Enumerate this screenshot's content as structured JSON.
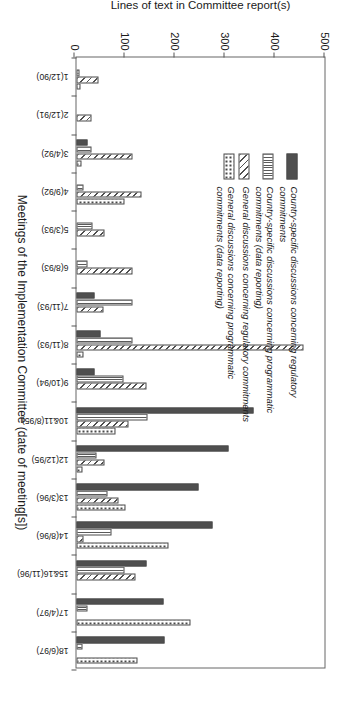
{
  "chart_data": {
    "type": "bar",
    "title": "",
    "subtitle": "",
    "xlabel": "Meetings of the Implementation Committee (date of meeting[s])",
    "ylabel": "Lines of text in Committee report(s)",
    "ylim": [
      0,
      500
    ],
    "yticks": [
      0,
      100,
      200,
      300,
      400,
      500
    ],
    "ytick_labels": [
      "0",
      "100",
      "200",
      "300",
      "400",
      "500"
    ],
    "grid": false,
    "orientation": "vertical-bars-rotated-90",
    "legend_position": "upper-left-inside",
    "categories": [
      "1(12/90)",
      "2(12/91)",
      "3(4/92)",
      "4(9/92)",
      "5(3/93)",
      "6(8/93)",
      "7(11/93)",
      "8(11/93)",
      "9(10/94)",
      "10&11(8/95)",
      "12(12/95)",
      "13(3/96)",
      "14(8/96)",
      "15&16(11/96)",
      "17(4/97)",
      "18(6/97)"
    ],
    "series": [
      {
        "name": "Country-specific discussions concerning regulatory commitments",
        "pattern": "solid",
        "color": "#4f4f4f",
        "values": [
          0,
          0,
          22,
          0,
          0,
          0,
          36,
          48,
          37,
          355,
          305,
          245,
          272,
          140,
          174,
          176
        ]
      },
      {
        "name": "Country-specific discussions concerning  programmatic commitments (data reporting)",
        "pattern": "vertical-lines",
        "color": "#5a5a5a",
        "values": [
          7,
          0,
          30,
          14,
          33,
          22,
          112,
          113,
          95,
          143,
          40,
          62,
          70,
          96,
          23,
          12
        ]
      },
      {
        "name": "General discussions concerning regulatory commitments",
        "pattern": "diagonal-hatch",
        "color": "#4f4f4f",
        "values": [
          45,
          30,
          113,
          130,
          56,
          112,
          54,
          455,
          140,
          104,
          56,
          84,
          14,
          118,
          0,
          0
        ]
      },
      {
        "name": "General discussions concerning programmatic commitments (data reporting)",
        "pattern": "dots",
        "color": "#3d3d3d",
        "values": [
          8,
          0,
          10,
          97,
          0,
          0,
          0,
          14,
          0,
          78,
          12,
          99,
          185,
          0,
          228,
          122
        ]
      }
    ]
  },
  "legend": {
    "items": [
      {
        "label": "Country-specific discussions concerning regulatory commitments",
        "swatch": "solid-dark-gray"
      },
      {
        "label": "Country-specific discussions concerning  programmatic commitments (data reporting)",
        "swatch": "vertical-line-hatch"
      },
      {
        "label": "General discussions concerning regulatory commitments",
        "swatch": "diagonal-hatch"
      },
      {
        "label": "General discussions concerning programmatic commitments (data reporting)",
        "swatch": "dotted"
      }
    ]
  }
}
